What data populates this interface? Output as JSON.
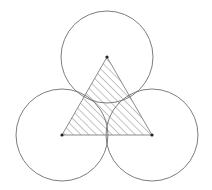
{
  "diagram": {
    "title": "",
    "colors": {
      "background": "#ffffff",
      "stroke": "#6e6e6e",
      "hatch": "#555555",
      "point": "#222222"
    },
    "circles": [
      {
        "name": "top-circle",
        "cx": 107,
        "cy": 57,
        "r": 46
      },
      {
        "name": "bottom-left-circle",
        "cx": 62,
        "cy": 135,
        "r": 46
      },
      {
        "name": "bottom-right-circle",
        "cx": 152,
        "cy": 135,
        "r": 46
      }
    ],
    "triangle": {
      "vertices": [
        [
          107,
          57
        ],
        [
          62,
          135
        ],
        [
          152,
          135
        ]
      ],
      "fill": "diagonal-hatch"
    },
    "points": [
      {
        "name": "top-vertex",
        "x": 107,
        "y": 57
      },
      {
        "name": "bottom-left-vertex",
        "x": 62,
        "y": 135
      },
      {
        "name": "bottom-right-vertex",
        "x": 152,
        "y": 135
      }
    ],
    "hatch_spacing": 5.5
  }
}
